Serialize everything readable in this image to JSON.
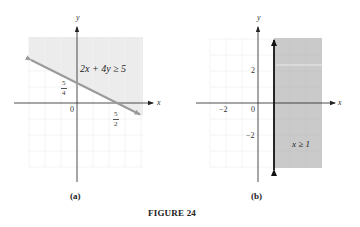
{
  "figure": {
    "title": "FIGURE 24",
    "panels": [
      {
        "id": "a",
        "caption": "(a)",
        "inequality": "2x + 4y ≥ 5",
        "axis_x_label": "x",
        "axis_y_label": "y",
        "origin_label": "0",
        "y_intercept_label": {
          "num": "5",
          "den": "4"
        },
        "x_intercept_label": {
          "num": "5",
          "den": "2"
        },
        "boundary": "2x + 4y = 5",
        "shaded_side": "above",
        "line_style": "solid"
      },
      {
        "id": "b",
        "caption": "(b)",
        "inequality": "x ≥ 1",
        "axis_x_label": "x",
        "axis_y_label": "y",
        "origin_label": "0",
        "tick_labels": {
          "x_neg": "−2",
          "y_pos": "2",
          "y_neg": "−2"
        },
        "boundary": "x = 1",
        "shaded_side": "right",
        "line_style": "solid-bold"
      }
    ]
  },
  "colors": {
    "shade_light": "#ececec",
    "shade_dark": "#c9c9c9",
    "grid": "#e6e6e6",
    "axis": "#222222",
    "boundary_a": "#9a9a9a",
    "boundary_b": "#111111"
  }
}
